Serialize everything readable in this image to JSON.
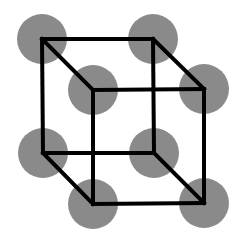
{
  "diagram": {
    "type": "simple cubic lattice unit cell",
    "colors": {
      "background": "#ffffff",
      "atom": "#8a8a8a",
      "edge": "#000000"
    },
    "atom_radius": 25,
    "edge_width": 4,
    "atoms": [
      {
        "id": "back-top-left",
        "x": 42,
        "y": 39
      },
      {
        "id": "back-top-right",
        "x": 153,
        "y": 39
      },
      {
        "id": "front-top-left",
        "x": 93,
        "y": 90
      },
      {
        "id": "front-top-right",
        "x": 204,
        "y": 89
      },
      {
        "id": "back-bottom-left",
        "x": 43,
        "y": 153
      },
      {
        "id": "back-bottom-right",
        "x": 154,
        "y": 153
      },
      {
        "id": "front-bottom-left",
        "x": 93,
        "y": 204
      },
      {
        "id": "front-bottom-right",
        "x": 204,
        "y": 203
      }
    ]
  }
}
